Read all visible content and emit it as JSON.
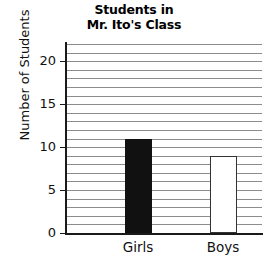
{
  "chart_data": {
    "type": "bar",
    "title": "Students in Mr. Ito's Class",
    "title_lines": [
      "Students in",
      "Mr. Ito's Class"
    ],
    "categories": [
      "Girls",
      "Boys"
    ],
    "values": [
      11,
      9
    ],
    "series": [
      {
        "name": "Number of Students",
        "values": [
          11,
          9
        ]
      }
    ],
    "xlabel": "",
    "ylabel": "Number of Students",
    "ylim": [
      0,
      22
    ],
    "ytick_labels": [
      "0",
      "5",
      "10",
      "15",
      "20"
    ],
    "ytick_values": [
      0,
      5,
      10,
      15,
      20
    ],
    "grid": true,
    "grid_interval": 1,
    "legend": false,
    "legend_position": "none",
    "bar_styles": [
      {
        "category": "Girls",
        "fill": "#111111",
        "stroke": "#111111",
        "style": "filled"
      },
      {
        "category": "Boys",
        "fill": "#ffffff",
        "stroke": "#333333",
        "style": "hollow"
      }
    ],
    "colors": {
      "background": "#ffffff",
      "axis": "#1a1a1a",
      "gridline": "#8c8c8c",
      "text": "#111111",
      "bar_filled": "#111111",
      "bar_hollow": "#ffffff"
    }
  }
}
